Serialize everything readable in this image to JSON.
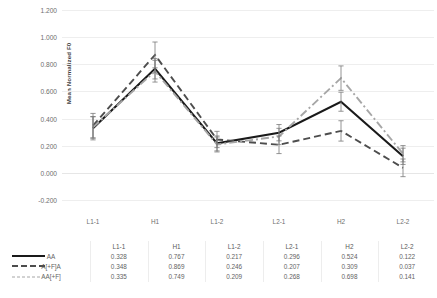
{
  "chart_data": {
    "type": "line",
    "title": "",
    "xlabel": "",
    "ylabel": "Mean Normalized F0",
    "ylim": [
      -0.2,
      1.2
    ],
    "ystep": 0.2,
    "yticks": [
      "1.200",
      "1.000",
      "0.800",
      "0.600",
      "0.400",
      "0.200",
      "0.000",
      "-0.200"
    ],
    "ytick_values": [
      1.2,
      1.0,
      0.8,
      0.6,
      0.4,
      0.2,
      0.0,
      -0.2
    ],
    "grid": true,
    "legend_position": "table-left",
    "categories": [
      "L1-1",
      "H1",
      "L1-2",
      "L2-1",
      "H2",
      "L2-2"
    ],
    "series": [
      {
        "name": "AA",
        "style": "solid",
        "color": "#1a1a1a",
        "values": [
          0.328,
          0.767,
          0.217,
          0.296,
          0.524,
          0.122
        ],
        "labels": [
          "0.328",
          "0.767",
          "0.217",
          "0.296",
          "0.524",
          "0.122"
        ],
        "errors": [
          0.085,
          0.075,
          0.055,
          0.06,
          0.07,
          0.06
        ]
      },
      {
        "name": "A[+F]A",
        "style": "dashed",
        "color": "#4d4d4d",
        "values": [
          0.348,
          0.869,
          0.246,
          0.207,
          0.309,
          0.037
        ],
        "labels": [
          "0.348",
          "0.869",
          "0.246",
          "0.207",
          "0.309",
          "0.037"
        ],
        "errors": [
          0.09,
          0.095,
          0.06,
          0.065,
          0.075,
          0.065
        ]
      },
      {
        "name": "AA[+F]",
        "style": "dashdot",
        "color": "#a6a6a6",
        "values": [
          0.335,
          0.749,
          0.209,
          0.268,
          0.698,
          0.141
        ],
        "labels": [
          "0.335",
          "0.749",
          "0.209",
          "0.268",
          "0.698",
          "0.141"
        ],
        "errors": [
          0.08,
          0.08,
          0.055,
          0.06,
          0.09,
          0.06
        ]
      }
    ]
  }
}
